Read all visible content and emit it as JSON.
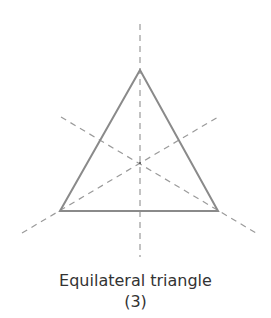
{
  "diagram": {
    "title": "Equilateral triangle",
    "subtitle": "(3)",
    "shape": "equilateral-triangle",
    "lines_of_symmetry": 3,
    "colors": {
      "triangle_stroke": "#8a8a8a",
      "symmetry_line": "#9a9a9a",
      "text": "#333333",
      "background": "#ffffff"
    },
    "vertices": [
      {
        "name": "top",
        "x": 140,
        "y": 70
      },
      {
        "name": "bottom-left",
        "x": 60,
        "y": 211
      },
      {
        "name": "bottom-right",
        "x": 218,
        "y": 211
      }
    ],
    "symmetry_lines": [
      {
        "name": "vertical",
        "x1": 140,
        "y1": 24,
        "x2": 140,
        "y2": 257
      },
      {
        "name": "descending",
        "x1": 61,
        "y1": 117,
        "x2": 256,
        "y2": 233
      },
      {
        "name": "ascending",
        "x1": 22,
        "y1": 233,
        "x2": 218,
        "y2": 117
      }
    ],
    "centroid": {
      "x": 140,
      "y": 163
    }
  }
}
